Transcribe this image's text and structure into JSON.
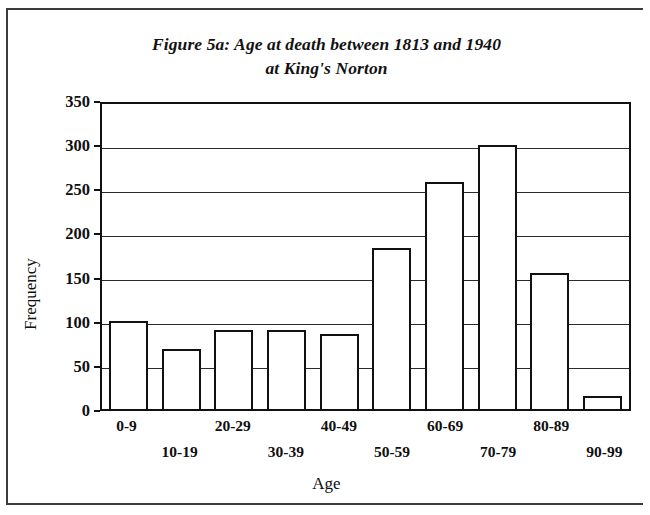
{
  "figure": {
    "title_line1": "Figure 5a: Age at death between 1813 and 1940",
    "title_line2": "at King's Norton"
  },
  "chart_data": {
    "type": "bar",
    "title": "Figure 5a: Age at death between 1813 and 1940 at King's Norton",
    "xlabel": "Age",
    "ylabel": "Frequency",
    "categories": [
      "0-9",
      "10-19",
      "20-29",
      "30-39",
      "40-49",
      "50-59",
      "60-69",
      "70-79",
      "80-89",
      "90-99"
    ],
    "values": [
      100,
      68,
      89,
      90,
      85,
      182,
      257,
      299,
      154,
      15
    ],
    "ylim": [
      0,
      350
    ],
    "yticks": [
      0,
      50,
      100,
      150,
      200,
      250,
      300,
      350
    ],
    "grid": true,
    "legend": false,
    "bar_fill": "#ffffff",
    "bar_edge": "#111111"
  }
}
